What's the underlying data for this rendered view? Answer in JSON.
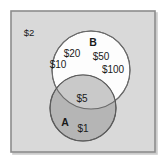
{
  "figure": {
    "type": "venn-diagram",
    "title": "",
    "universe": {
      "label": "$2",
      "name": "universal-set",
      "fill_color": "#d9d9d9",
      "border_color": "#8c8c8c"
    },
    "sets": [
      {
        "id": "B",
        "label": "B",
        "fill_color": "#ffffff",
        "border_color": "#6b6b6b",
        "only_members": [
          "$20",
          "$50",
          "$10",
          "$100"
        ]
      },
      {
        "id": "A",
        "label": "A",
        "fill_color": "#b3b3b3",
        "border_color": "#5c5c5c",
        "only_members": [
          "$1"
        ]
      }
    ],
    "intersection": {
      "label": "A-and-B",
      "fill_color": "#c4c4c4",
      "members": [
        "$5"
      ]
    },
    "labels": [
      {
        "name": "universe-label-2",
        "text": "$2",
        "x": 29,
        "y": 36,
        "class": "lbl-universe"
      },
      {
        "name": "set-b-label",
        "text": "B",
        "x": 93,
        "y": 46,
        "class": "lbl-set"
      },
      {
        "name": "set-b-member-20",
        "text": "$20",
        "x": 72,
        "y": 57,
        "class": "lbl-amount"
      },
      {
        "name": "set-b-member-50",
        "text": "$50",
        "x": 101,
        "y": 60,
        "class": "lbl-amount"
      },
      {
        "name": "set-b-member-10",
        "text": "$10",
        "x": 58,
        "y": 68,
        "class": "lbl-amount"
      },
      {
        "name": "set-b-member-100",
        "text": "$100",
        "x": 113,
        "y": 73,
        "class": "lbl-amount"
      },
      {
        "name": "intersection-member-5",
        "text": "$5",
        "x": 82,
        "y": 102,
        "class": "lbl-amount"
      },
      {
        "name": "set-a-label",
        "text": "A",
        "x": 65,
        "y": 126,
        "class": "lbl-set"
      },
      {
        "name": "set-a-member-1",
        "text": "$1",
        "x": 83,
        "y": 132,
        "class": "lbl-amount"
      }
    ],
    "geometry": {
      "frame": {
        "x": 11,
        "y": 11,
        "width": 144,
        "height": 141
      },
      "circle_b": {
        "cx": 91,
        "cy": 70,
        "r": 39
      },
      "circle_a": {
        "cx": 83,
        "cy": 108,
        "r": 33
      }
    }
  }
}
